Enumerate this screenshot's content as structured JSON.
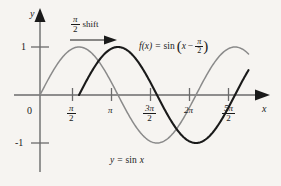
{
  "figure": {
    "background_color": "#f6f4f1",
    "axis_color": "#6b6b6b",
    "sine_color": "#8a8a8a",
    "shifted_color": "#1a1a1a"
  },
  "axes": {
    "y_axis_label": "y",
    "x_axis_label": "x",
    "origin_label": "0",
    "y_ticks": [
      {
        "label": "1",
        "value": 1
      },
      {
        "label": "-1",
        "value": -1
      }
    ],
    "x_ticks": [
      {
        "label_num": "π",
        "label_den": "2",
        "value": 1.5708,
        "is_fraction": true
      },
      {
        "label_num": "π",
        "label_den": "",
        "value": 3.1416,
        "is_fraction": false
      },
      {
        "label_num": "3π",
        "label_den": "2",
        "value": 4.7124,
        "is_fraction": true
      },
      {
        "label_num": "2π",
        "label_den": "",
        "value": 6.2832,
        "is_fraction": false
      },
      {
        "label_num": "5π",
        "label_den": "2",
        "value": 7.854,
        "is_fraction": true
      }
    ]
  },
  "annotations": {
    "shift_label_num": "π",
    "shift_label_den": "2",
    "shift_label_text": "shift",
    "function_label_lhs": "f(x)",
    "function_label_eq": "=",
    "function_label_fn": "sin",
    "function_label_arg_x": "x",
    "function_label_arg_minus": "−",
    "function_label_arg_num": "π",
    "function_label_arg_den": "2",
    "base_curve_label_y": "y",
    "base_curve_label_eq": "=",
    "base_curve_label_fn": "sin",
    "base_curve_label_x": "x"
  },
  "chart_data": {
    "type": "line",
    "title": "",
    "xlabel": "x",
    "ylabel": "y",
    "xlim": [
      -0.35,
      8.6
    ],
    "ylim": [
      -1.45,
      1.5
    ],
    "grid": false,
    "legend_position": "inline-annotation",
    "x_tick_values": [
      1.5708,
      3.1416,
      4.7124,
      6.2832,
      7.854
    ],
    "x_tick_labels": [
      "π/2",
      "π",
      "3π/2",
      "2π",
      "5π/2"
    ],
    "y_tick_values": [
      1,
      -1
    ],
    "y_tick_labels": [
      "1",
      "-1"
    ],
    "series": [
      {
        "name": "y = sin x",
        "color": "#8a8a8a",
        "formula": "sin(x)",
        "phase": 0,
        "amplitude": 1,
        "x_start": 0,
        "x_end": 8.4,
        "key_points": [
          {
            "x": 0,
            "y": 0
          },
          {
            "x": 1.5708,
            "y": 1
          },
          {
            "x": 3.1416,
            "y": 0
          },
          {
            "x": 4.7124,
            "y": -1
          },
          {
            "x": 6.2832,
            "y": 0
          },
          {
            "x": 7.854,
            "y": 1
          }
        ]
      },
      {
        "name": "f(x) = sin(x - π/2)",
        "color": "#1a1a1a",
        "formula": "sin(x - pi/2)",
        "phase": 1.5708,
        "amplitude": 1,
        "x_start": 1.5708,
        "x_end": 8.4,
        "key_points": [
          {
            "x": 1.5708,
            "y": 0
          },
          {
            "x": 3.1416,
            "y": 1
          },
          {
            "x": 4.7124,
            "y": 0
          },
          {
            "x": 6.2832,
            "y": -1
          },
          {
            "x": 7.854,
            "y": 0
          }
        ]
      }
    ],
    "annotation_arrow": {
      "label": "π/2 shift",
      "from_x": 1.5708,
      "to_x": 3.1416,
      "y": 1.35
    }
  }
}
